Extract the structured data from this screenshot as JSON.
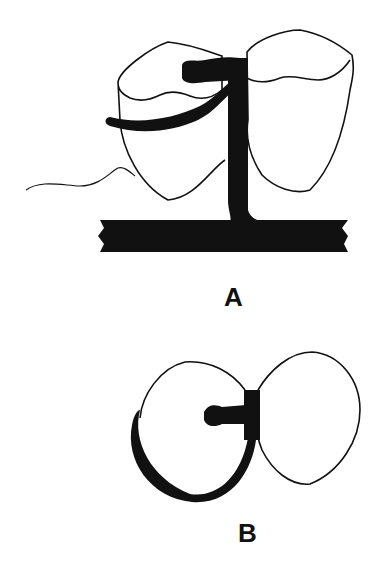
{
  "figure": {
    "panels": [
      {
        "id": "A",
        "label": "A",
        "description": "Side view: two teeth with a matrix band and retainer post mounted on a base bar"
      },
      {
        "id": "B",
        "label": "B",
        "description": "Occlusal view: band wrapping around one tooth, joined to post between teeth"
      }
    ],
    "colors": {
      "ink": "#111111",
      "background": "#ffffff"
    }
  }
}
